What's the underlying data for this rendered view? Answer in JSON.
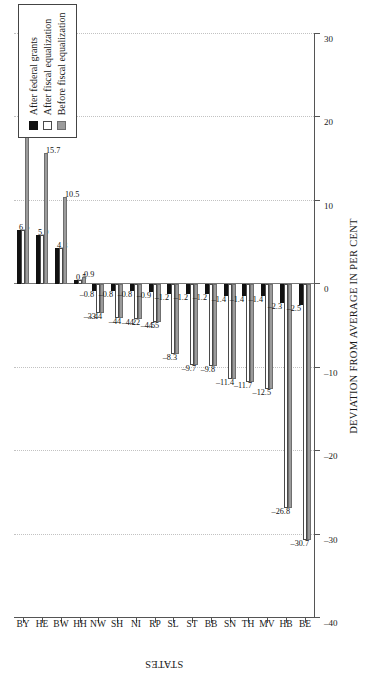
{
  "chart_data": {
    "type": "bar",
    "orientation": "vertical-grouped-rotated",
    "title": "",
    "xlabel": "STATES",
    "ylabel": "DEVIATION FROM AVERAGE IN PER CENT",
    "categories": [
      "BY",
      "HE",
      "BW",
      "HH",
      "NW",
      "SH",
      "NI",
      "RP",
      "SL",
      "ST",
      "BB",
      "SN",
      "TH",
      "MV",
      "HB",
      "BE"
    ],
    "ylim": [
      -40,
      30
    ],
    "yticks": [
      30,
      20,
      10,
      0,
      -10,
      -20,
      -30,
      -40
    ],
    "ytick_labels": [
      "30",
      "20",
      "10",
      "0",
      "–10",
      "–20",
      "–30",
      "–40"
    ],
    "grid": true,
    "legend_position": "upper-right",
    "series": [
      {
        "name": "After federal grants",
        "color": "#111111",
        "values": [
          6.5,
          5.9,
          4.3,
          0.5,
          -0.8,
          -0.8,
          -0.8,
          -0.9,
          -1.2,
          -1.2,
          -1.2,
          -1.4,
          -1.4,
          -1.4,
          -2.3,
          -2.5
        ],
        "labels": [
          "6.5",
          "5.9",
          "4.3",
          "0.5",
          "–0.8",
          "–0.8",
          "–0.8",
          "–0.9",
          "–1.2",
          "–1.2",
          "–1.2",
          "–1.4",
          "–1.4",
          "–1.4",
          "–2.3",
          "–2.5"
        ]
      },
      {
        "name": "After fiscal equalization",
        "color": "#ffffff",
        "values": [
          6.5,
          5.9,
          4.3,
          0.5,
          -3.4,
          -4.0,
          -4.2,
          -4.5,
          -8.3,
          -9.7,
          -9.8,
          -11.4,
          -11.7,
          -12.5,
          -26.8,
          -30.7
        ],
        "labels": [
          "",
          "",
          "",
          "",
          "–3.4",
          "–4",
          "–4.2",
          "–4.5",
          "",
          "",
          "",
          "",
          "",
          "",
          "",
          ""
        ]
      },
      {
        "name": "Before fiscal equalization",
        "color": "#9b9b9b",
        "values": [
          17.6,
          15.7,
          10.5,
          0.9,
          -3.4,
          -4.0,
          -4.2,
          -4.5,
          -8.3,
          -9.7,
          -9.8,
          -11.4,
          -11.7,
          -12.5,
          -26.8,
          -30.7
        ],
        "labels": [
          "17.6",
          "15.7",
          "10.5",
          "0.9",
          "–3.4",
          "–4",
          "–4.2",
          "–4.5",
          "–8.3",
          "–9.7",
          "–9.8",
          "–11.4",
          "–11.7",
          "–12.5",
          "–26.8",
          "–30.7"
        ]
      }
    ]
  },
  "legend": {
    "items": [
      {
        "label": "After federal grants"
      },
      {
        "label": "After fiscal equalization"
      },
      {
        "label": "Before fiscal equalization"
      }
    ]
  },
  "axes": {
    "value_axis_title": "DEVIATION FROM AVERAGE IN PER CENT",
    "category_axis_title": "STATES"
  }
}
